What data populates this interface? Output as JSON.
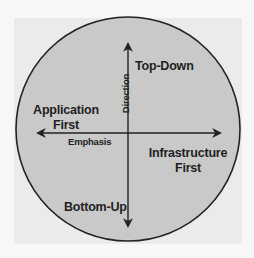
{
  "diagram": {
    "type": "quadrant-circle",
    "axes": {
      "vertical": {
        "label": "Direction",
        "top_end": "Top-Down",
        "bottom_end": "Bottom-Up"
      },
      "horizontal": {
        "label": "Emphasis",
        "left_end": "Application First",
        "right_end": "Infrastructure First"
      }
    },
    "labels": {
      "top": "Top-Down",
      "bottom": "Bottom-Up",
      "left_line1": "Application",
      "left_line2": "First",
      "right_line1": "Infrastructure",
      "right_line2": "First",
      "vertical_axis": "Direction",
      "horizontal_axis": "Emphasis"
    },
    "colors": {
      "page_background": "#f7f7f7",
      "panel_background": "#ebebeb",
      "circle_fill": "#c9c9c9",
      "stroke": "#222222",
      "text": "#1f1f1f"
    }
  }
}
